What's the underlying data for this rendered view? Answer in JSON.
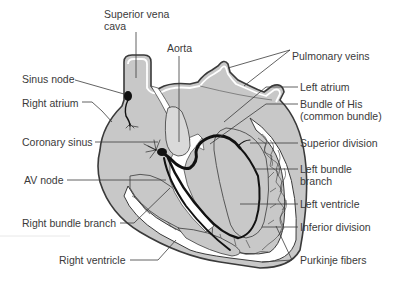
{
  "diagram": {
    "colors": {
      "tissue_fill": "#c8c8c8",
      "outline": "#3a3a3a",
      "conduction_path": "#111111",
      "text": "#3a3a3a",
      "background": "#ffffff",
      "aorta_fill": "#d9d9d9"
    },
    "labels": {
      "superior_vena_cava_line1": "Superior vena",
      "superior_vena_cava_line2": "cava",
      "aorta": "Aorta",
      "pulmonary_veins": "Pulmonary veins",
      "sinus_node": "Sinus node",
      "right_atrium": "Right atrium",
      "left_atrium": "Left atrium",
      "bundle_of_his_line1": "Bundle of His",
      "bundle_of_his_line2": "(common bundle)",
      "coronary_sinus": "Coronary sinus",
      "superior_division": "Superior division",
      "av_node": "AV node",
      "left_bundle_branch_line1": "Left bundle",
      "left_bundle_branch_line2": "branch",
      "left_ventricle": "Left ventricle",
      "right_bundle_branch": "Right bundle branch",
      "inferior_division": "Inferior division",
      "right_ventricle": "Right ventricle",
      "purkinje_fibers": "Purkinje fibers"
    }
  }
}
